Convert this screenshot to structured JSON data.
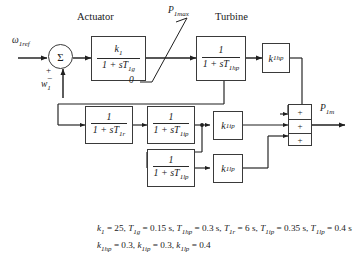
{
  "diagram": {
    "sections": {
      "actuator": "Actuator",
      "turbine": "Turbine"
    },
    "inputs": {
      "reference": {
        "base": "ω",
        "sub": "1ref"
      },
      "feedback": {
        "base": "w",
        "sub": "1"
      }
    },
    "summing_junction": {
      "symbol": "Σ",
      "sign_plus": "+",
      "sign_minus": "−"
    },
    "limiter": {
      "upper": {
        "base": "P",
        "sub": "1max"
      },
      "lower": "0"
    },
    "blocks": {
      "actuator_tf": {
        "num": "k",
        "num_sub": "1",
        "den_pre": "1 + s",
        "den_var": "T",
        "den_sub": "1g"
      },
      "hp_tf": {
        "num": "1",
        "num_sub": "",
        "den_pre": "1 + s",
        "den_var": "T",
        "den_sub": "1hp"
      },
      "reheat_tf": {
        "num": "1",
        "num_sub": "",
        "den_pre": "1 + s",
        "den_var": "T",
        "den_sub": "1r"
      },
      "ip_tf": {
        "num": "1",
        "num_sub": "",
        "den_pre": "1 + s",
        "den_var": "T",
        "den_sub": "1ip"
      },
      "lp_tf": {
        "num": "1",
        "num_sub": "",
        "den_pre": "1 + s",
        "den_var": "T",
        "den_sub": "1lp"
      },
      "gain_hp": {
        "base": "k",
        "sub": "1hp"
      },
      "gain_ip": {
        "base": "k",
        "sub": "1ip"
      },
      "gain_lp": {
        "base": "k",
        "sub": "1lp"
      }
    },
    "adder": {
      "signs": [
        "+",
        "+",
        "+"
      ]
    },
    "output": {
      "base": "P",
      "sub": "1m"
    },
    "parameters": {
      "line1": [
        {
          "name": "k",
          "sub": "1",
          "value": "25"
        },
        {
          "name": "T",
          "sub": "1g",
          "value": "0.15 s"
        },
        {
          "name": "T",
          "sub": "1hp",
          "value": "0.3 s"
        },
        {
          "name": "T",
          "sub": "1r",
          "value": "6 s"
        },
        {
          "name": "T",
          "sub": "1ip",
          "value": "0.35 s"
        },
        {
          "name": "T",
          "sub": "1lp",
          "value": "0.4 s"
        }
      ],
      "line2": [
        {
          "name": "k",
          "sub": "1hp",
          "value": "0.3"
        },
        {
          "name": "k",
          "sub": "1ip",
          "value": "0.3"
        },
        {
          "name": "k",
          "sub": "1lp",
          "value": "0.4"
        }
      ],
      "line1_text": "k₁ = 25, T₁g = 0.15 s, T₁hp = 0.3 s, T₁r = 6 s, T₁ip = 0.35 s, T₁lp = 0.4 s",
      "line2_text": "k₁hp = 0.3, k₁ip = 0.3, k₁lp = 0.4"
    }
  }
}
